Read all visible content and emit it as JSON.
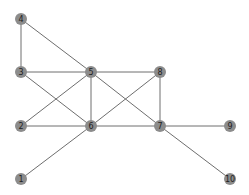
{
  "graph": {
    "nodes": [
      {
        "id": "1",
        "label": "1",
        "x": 21,
        "y": 179
      },
      {
        "id": "2",
        "label": "2",
        "x": 21,
        "y": 126
      },
      {
        "id": "3",
        "label": "3",
        "x": 21,
        "y": 72
      },
      {
        "id": "4",
        "label": "4",
        "x": 21,
        "y": 19
      },
      {
        "id": "5",
        "label": "5",
        "x": 91,
        "y": 72
      },
      {
        "id": "6",
        "label": "6",
        "x": 91,
        "y": 126
      },
      {
        "id": "7",
        "label": "7",
        "x": 160,
        "y": 126
      },
      {
        "id": "8",
        "label": "8",
        "x": 160,
        "y": 72
      },
      {
        "id": "9",
        "label": "9",
        "x": 230,
        "y": 126
      },
      {
        "id": "10",
        "label": "10",
        "x": 230,
        "y": 179
      }
    ],
    "edges": [
      [
        "4",
        "3"
      ],
      [
        "4",
        "5"
      ],
      [
        "3",
        "5"
      ],
      [
        "3",
        "6"
      ],
      [
        "2",
        "5"
      ],
      [
        "2",
        "6"
      ],
      [
        "1",
        "6"
      ],
      [
        "5",
        "8"
      ],
      [
        "5",
        "6"
      ],
      [
        "5",
        "7"
      ],
      [
        "6",
        "8"
      ],
      [
        "6",
        "7"
      ],
      [
        "8",
        "7"
      ],
      [
        "7",
        "9"
      ],
      [
        "7",
        "10"
      ]
    ],
    "colors": {
      "node_fill": "#8c8c8c",
      "edge": "#6e6e6e",
      "label": "#222222",
      "background": "#ffffff"
    },
    "node_radius": 6
  }
}
